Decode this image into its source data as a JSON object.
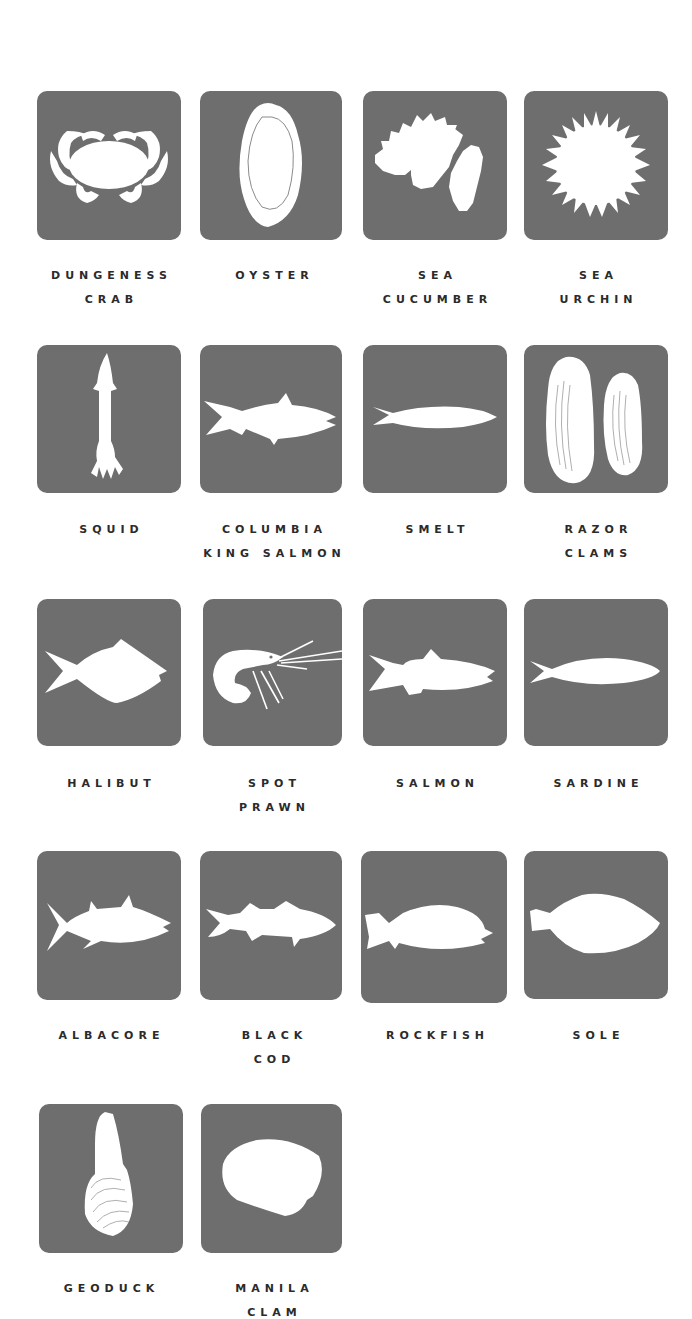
{
  "colors": {
    "tile_background": "#6e6e6e",
    "silhouette": "#ffffff",
    "label_text": "#2b2b2b",
    "page_background": "#ffffff"
  },
  "species": [
    {
      "name_line1": "DUNGENESS",
      "name_line2": "CRAB",
      "icon": "crab-icon"
    },
    {
      "name_line1": "OYSTER",
      "name_line2": "",
      "icon": "oyster-icon"
    },
    {
      "name_line1": "SEA",
      "name_line2": "CUCUMBER",
      "icon": "sea-cucumber-icon"
    },
    {
      "name_line1": "SEA",
      "name_line2": "URCHIN",
      "icon": "sea-urchin-icon"
    },
    {
      "name_line1": "SQUID",
      "name_line2": "",
      "icon": "squid-icon"
    },
    {
      "name_line1": "COLUMBIA",
      "name_line2": "KING SALMON",
      "icon": "king-salmon-icon"
    },
    {
      "name_line1": "SMELT",
      "name_line2": "",
      "icon": "smelt-icon"
    },
    {
      "name_line1": "RAZOR",
      "name_line2": "CLAMS",
      "icon": "razor-clams-icon"
    },
    {
      "name_line1": "HALIBUT",
      "name_line2": "",
      "icon": "halibut-icon"
    },
    {
      "name_line1": "SPOT",
      "name_line2": "PRAWN",
      "icon": "spot-prawn-icon"
    },
    {
      "name_line1": "SALMON",
      "name_line2": "",
      "icon": "salmon-icon"
    },
    {
      "name_line1": "SARDINE",
      "name_line2": "",
      "icon": "sardine-icon"
    },
    {
      "name_line1": "ALBACORE",
      "name_line2": "",
      "icon": "albacore-icon"
    },
    {
      "name_line1": "BLACK",
      "name_line2": "COD",
      "icon": "black-cod-icon"
    },
    {
      "name_line1": "ROCKFISH",
      "name_line2": "",
      "icon": "rockfish-icon"
    },
    {
      "name_line1": "SOLE",
      "name_line2": "",
      "icon": "sole-icon"
    },
    {
      "name_line1": "GEODUCK",
      "name_line2": "",
      "icon": "geoduck-icon"
    },
    {
      "name_line1": "MANILA",
      "name_line2": "CLAM",
      "icon": "manila-clam-icon"
    }
  ]
}
